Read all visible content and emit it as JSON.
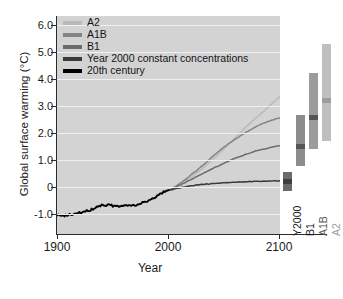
{
  "chart_data": {
    "type": "line",
    "title": "",
    "xlabel": "Year",
    "ylabel": "Global surface warming (°C)",
    "xlim": [
      1900,
      2100
    ],
    "ylim": [
      -1.3,
      6.4
    ],
    "xticks": [
      1900,
      2000,
      2100
    ],
    "xtick_labels": [
      "1900",
      "2000",
      "2100"
    ],
    "yticks": [
      -1.0,
      0,
      1.0,
      2.0,
      3.0,
      4.0,
      5.0,
      6.0
    ],
    "ytick_labels": [
      "-1.0",
      "0",
      "1.0",
      "2.0",
      "3.0",
      "4.0",
      "5.0",
      "6.0"
    ],
    "grid": true,
    "grid_color": "#f0f0f0",
    "plot_background": "#d3d3d3",
    "legend_position": "top-left",
    "series": [
      {
        "name": "A2",
        "color": "#b9b9b9",
        "x": [
          2000,
          2010,
          2020,
          2030,
          2040,
          2050,
          2060,
          2070,
          2080,
          2090,
          2100
        ],
        "values": [
          0.25,
          0.45,
          0.7,
          1.0,
          1.35,
          1.72,
          2.1,
          2.5,
          2.85,
          3.2,
          3.55
        ]
      },
      {
        "name": "A1B",
        "color": "#848484",
        "x": [
          2000,
          2010,
          2020,
          2030,
          2040,
          2050,
          2060,
          2070,
          2080,
          2090,
          2100
        ],
        "values": [
          0.25,
          0.48,
          0.78,
          1.1,
          1.45,
          1.78,
          2.05,
          2.3,
          2.52,
          2.68,
          2.8
        ]
      },
      {
        "name": "B1",
        "color": "#6b6b6b",
        "x": [
          2000,
          2010,
          2020,
          2030,
          2040,
          2050,
          2060,
          2070,
          2080,
          2090,
          2100
        ],
        "values": [
          0.25,
          0.42,
          0.62,
          0.82,
          1.02,
          1.2,
          1.38,
          1.52,
          1.65,
          1.74,
          1.82
        ]
      },
      {
        "name": "Year 2000 constant concentrations",
        "color": "#3a3a3a",
        "x": [
          2000,
          2010,
          2020,
          2030,
          2040,
          2050,
          2060,
          2070,
          2080,
          2090,
          2100
        ],
        "values": [
          0.25,
          0.33,
          0.4,
          0.45,
          0.48,
          0.51,
          0.53,
          0.55,
          0.56,
          0.57,
          0.58
        ]
      },
      {
        "name": "20th century",
        "color": "#000000",
        "x": [
          1900,
          1910,
          1920,
          1930,
          1940,
          1950,
          1960,
          1970,
          1980,
          1990,
          2000
        ],
        "values": [
          -0.65,
          -0.63,
          -0.55,
          -0.45,
          -0.28,
          -0.3,
          -0.3,
          -0.27,
          -0.15,
          0.05,
          0.25
        ]
      }
    ],
    "legend": [
      {
        "label": "A2",
        "color": "#b9b9b9"
      },
      {
        "label": "A1B",
        "color": "#848484"
      },
      {
        "label": "B1",
        "color": "#6b6b6b"
      },
      {
        "label": "Year 2000 constant concentrations",
        "color": "#3a3a3a"
      },
      {
        "label": "20th century",
        "color": "#000000"
      }
    ],
    "range_bars": {
      "description": "Likely range of global surface warming at 2090-2099 relative to 1980-1999",
      "bars": [
        {
          "label": "Y2000",
          "low": 0.2,
          "high": 0.9,
          "best": 0.55,
          "color": "#6b6b6b",
          "label_color": "#1a1a1a"
        },
        {
          "label": "B1",
          "low": 1.1,
          "high": 2.9,
          "best": 1.8,
          "color": "#8c8c8c",
          "label_color": "#1a1a1a"
        },
        {
          "label": "A1B",
          "low": 1.7,
          "high": 4.4,
          "best": 2.8,
          "color": "#9c9c9c",
          "label_color": "#555555"
        },
        {
          "label": "A2",
          "low": 2.0,
          "high": 5.4,
          "best": 3.4,
          "color": "#bfbfbf",
          "label_color": "#9a9a9a"
        }
      ]
    }
  }
}
